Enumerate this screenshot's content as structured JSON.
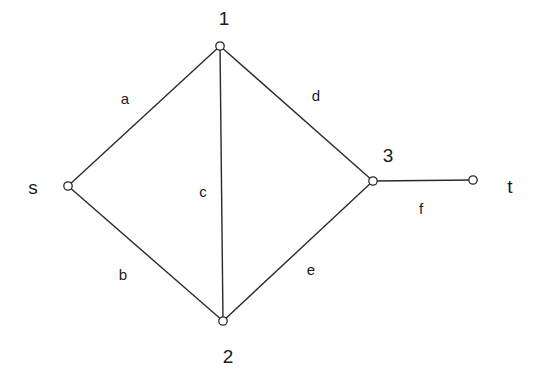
{
  "diagram": {
    "type": "network-graph",
    "nodes": [
      {
        "id": "s",
        "label": "s"
      },
      {
        "id": "1",
        "label": "1"
      },
      {
        "id": "2",
        "label": "2"
      },
      {
        "id": "3",
        "label": "3"
      },
      {
        "id": "t",
        "label": "t"
      }
    ],
    "edges": [
      {
        "id": "a",
        "label": "a",
        "from": "s",
        "to": "1"
      },
      {
        "id": "b",
        "label": "b",
        "from": "s",
        "to": "2"
      },
      {
        "id": "c",
        "label": "c",
        "from": "1",
        "to": "2"
      },
      {
        "id": "d",
        "label": "d",
        "from": "1",
        "to": "3"
      },
      {
        "id": "e",
        "label": "e",
        "from": "2",
        "to": "3"
      },
      {
        "id": "f",
        "label": "f",
        "from": "3",
        "to": "t"
      }
    ]
  }
}
